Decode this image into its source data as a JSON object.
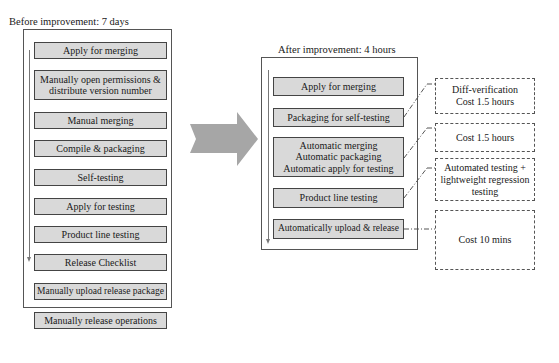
{
  "before": {
    "title": "Before improvement: 7 days",
    "steps": [
      "Apply for merging",
      "Manually open permissions &\ndistribute version number",
      "Manual merging",
      "Compile & packaging",
      "Self-testing",
      "Apply for testing",
      "Product line testing",
      "Release Checklist",
      "Manually upload release package",
      "Manually release operations"
    ]
  },
  "after": {
    "title": "After improvement: 4 hours",
    "steps": [
      "Apply for merging",
      "Packaging for self-testing",
      "Automatic merging\nAutomatic packaging\nAutomatic apply for testing",
      "Product line testing",
      "Automatically upload & release"
    ]
  },
  "notes": [
    "Diff-verification\nCost 1.5 hours",
    "Cost 1.5 hours",
    "Automated testing +\nlightweight regression\ntesting",
    "Cost 10 mins"
  ],
  "colors": {
    "step_fill": "#d9d9d9",
    "arrow_fill": "#a6a6a6",
    "border": "#444444"
  }
}
